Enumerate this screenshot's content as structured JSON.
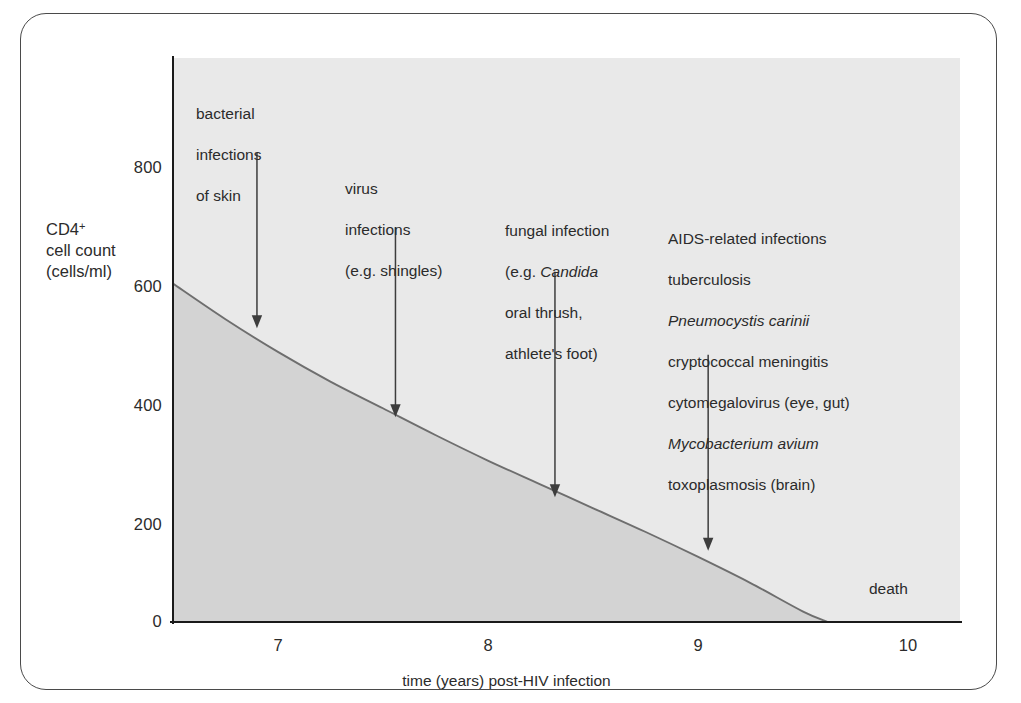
{
  "chart_data": {
    "type": "area",
    "title": "",
    "xlabel": "time (years) post-HIV infection",
    "ylabel": "CD4+ cell count (cells/ml)",
    "xlim": [
      6.5,
      10.25
    ],
    "ylim": [
      0,
      950
    ],
    "xticks": [
      7,
      8,
      9,
      10
    ],
    "yticks": [
      0,
      200,
      400,
      600,
      800
    ],
    "grid": false,
    "legend": null,
    "series": [
      {
        "name": "CD4+ cell count",
        "x": [
          6.5,
          6.75,
          7.0,
          7.25,
          7.5,
          7.75,
          8.0,
          8.25,
          8.5,
          8.75,
          9.0,
          9.25,
          9.5,
          9.62
        ],
        "values": [
          570,
          510,
          455,
          405,
          360,
          315,
          272,
          232,
          192,
          152,
          110,
          66,
          18,
          0
        ]
      }
    ],
    "annotations": [
      {
        "label": "bacterial\ninfections\nof skin",
        "x": 6.9,
        "arrow_from_y": 790,
        "arrow_to_y": 495
      },
      {
        "label": "virus\ninfections\n(e.g. shingles)",
        "x": 7.56,
        "arrow_from_y": 665,
        "arrow_to_y": 345
      },
      {
        "label": "fungal infection\n(e.g. Candida\noral thrush,\nathlete's foot)",
        "x": 8.32,
        "arrow_from_y": 590,
        "arrow_to_y": 210
      },
      {
        "label": "AIDS-related infections\ntuberculosis\nPneumocystis carinii\ncryptococcal meningitis\ncytomegalovirus (eye, gut)\nMycobacterium avium\ntoxoplasmosis (brain)",
        "x": 9.05,
        "arrow_from_y": 450,
        "arrow_to_y": 120
      }
    ],
    "death_label": "death",
    "death_x": 9.9
  },
  "axis": {
    "y_title_line1": "CD4",
    "y_title_sup": "+",
    "y_title_line2": "cell count",
    "y_title_line3": "(cells/ml)",
    "x_title": "time (years) post-HIV infection",
    "ytick_labels": [
      "800",
      "600",
      "400",
      "200",
      "0"
    ],
    "xtick_labels": [
      "7",
      "8",
      "9",
      "10"
    ]
  },
  "annotations": {
    "a0_line1": "bacterial",
    "a0_line2": "infections",
    "a0_line3": "of skin",
    "a1_line1": "virus",
    "a1_line2": "infections",
    "a1_line3": "(e.g. shingles)",
    "a2_line1": "fungal infection",
    "a2_line2_pre": "(e.g. ",
    "a2_line2_it": "Candida",
    "a2_line3": "oral thrush,",
    "a2_line4": "athlete's foot)",
    "a3_line1": "AIDS-related infections",
    "a3_line2": "tuberculosis",
    "a3_line3_it": "Pneumocystis carinii",
    "a3_line4": "cryptococcal meningitis",
    "a3_line5": "cytomegalovirus (eye, gut)",
    "a3_line6_it": "Mycobacterium avium",
    "a3_line7": "toxoplasmosis (brain)",
    "death": "death"
  },
  "colors": {
    "plot_background": "#e9e9e9",
    "area_fill": "#d3d3d3",
    "curve_line": "#6e6e6e",
    "axis_line": "#1a1a1a",
    "text": "#2b2b2b",
    "frame_border": "#4a4a4a"
  }
}
